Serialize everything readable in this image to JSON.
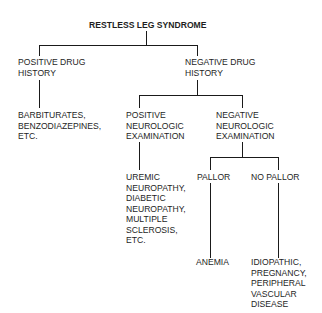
{
  "diagram": {
    "type": "decision-tree",
    "root": {
      "label": "RESTLESS LEG SYNDROME",
      "children": [
        {
          "label": "POSITIVE DRUG\nHISTORY",
          "children": [
            {
              "label": "BARBITURATES,\nBENZODIAZEPINES,\nETC."
            }
          ]
        },
        {
          "label": "NEGATIVE DRUG\nHISTORY",
          "children": [
            {
              "label": "POSITIVE\nNEUROLOGIC\nEXAMINATION",
              "children": [
                {
                  "label": "UREMIC\nNEUROPATHY,\nDIABETIC\nNEUROPATHY,\nMULTIPLE\nSCLEROSIS,\nETC."
                }
              ]
            },
            {
              "label": "NEGATIVE\nNEUROLOGIC\nEXAMINATION",
              "children": [
                {
                  "label": "PALLOR",
                  "children": [
                    {
                      "label": "ANEMIA"
                    }
                  ]
                },
                {
                  "label": "NO PALLOR",
                  "children": [
                    {
                      "label": "IDIOPATHIC,\nPREGNANCY,\nPERIPHERAL\nVASCULAR\nDISEASE"
                    }
                  ]
                }
              ]
            }
          ]
        }
      ]
    }
  },
  "nodes": {
    "root": "RESTLESS LEG SYNDROME",
    "positive_drug_history": "POSITIVE DRUG\nHISTORY",
    "drug_causes": "BARBITURATES,\nBENZODIAZEPINES,\nETC.",
    "negative_drug_history": "NEGATIVE DRUG\nHISTORY",
    "positive_neuro_exam": "POSITIVE\nNEUROLOGIC\nEXAMINATION",
    "neuro_causes": "UREMIC\nNEUROPATHY,\nDIABETIC\nNEUROPATHY,\nMULTIPLE\nSCLEROSIS,\nETC.",
    "negative_neuro_exam": "NEGATIVE\nNEUROLOGIC\nEXAMINATION",
    "pallor": "PALLOR",
    "anemia": "ANEMIA",
    "no_pallor": "NO PALLOR",
    "other_causes": "IDIOPATHIC,\nPREGNANCY,\nPERIPHERAL\nVASCULAR\nDISEASE"
  },
  "colors": {
    "line": "#1a1a1a",
    "text": "#1e1e1e",
    "background": "#ffffff"
  }
}
